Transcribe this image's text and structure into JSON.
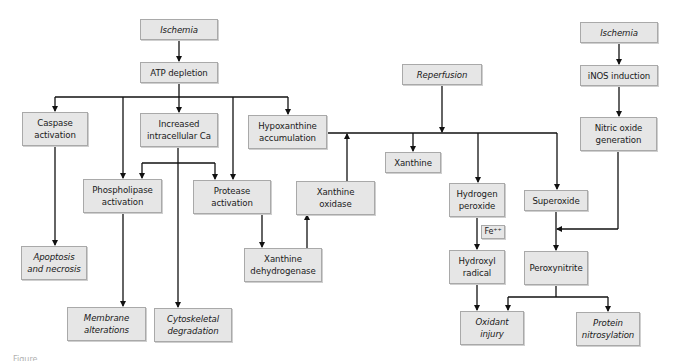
{
  "diagram": {
    "type": "flowchart",
    "nodes": [
      {
        "id": "ischemia_left",
        "label": "Ischemia",
        "italic": true
      },
      {
        "id": "atp_depletion",
        "label": "ATP depletion",
        "italic": false
      },
      {
        "id": "caspase_activation",
        "label": "Caspase\nactivation",
        "italic": false
      },
      {
        "id": "increased_ca",
        "label": "Increased\nintracellular Ca",
        "italic": false
      },
      {
        "id": "hypoxanthine",
        "label": "Hypoxanthine\naccumulation",
        "italic": false
      },
      {
        "id": "phospholipase",
        "label": "Phospholipase\nactivation",
        "italic": false
      },
      {
        "id": "protease",
        "label": "Protease\nactivation",
        "italic": false
      },
      {
        "id": "xanthine_oxidase",
        "label": "Xanthine\noxidase",
        "italic": false
      },
      {
        "id": "apoptosis",
        "label": "Apoptosis\nand necrosis",
        "italic": true
      },
      {
        "id": "xanthine_dehydrogenase",
        "label": "Xanthine\ndehydrogenase",
        "italic": false
      },
      {
        "id": "membrane",
        "label": "Membrane\nalterations",
        "italic": true
      },
      {
        "id": "cytoskeletal",
        "label": "Cytoskeletal\ndegradation",
        "italic": true
      },
      {
        "id": "reperfusion",
        "label": "Reperfusion",
        "italic": true
      },
      {
        "id": "xanthine",
        "label": "Xanthine",
        "italic": false
      },
      {
        "id": "hydrogen_peroxide",
        "label": "Hydrogen\nperoxide",
        "italic": false
      },
      {
        "id": "superoxide",
        "label": "Superoxide",
        "italic": false
      },
      {
        "id": "fe",
        "label": "Fe⁺⁺",
        "italic": false
      },
      {
        "id": "hydroxyl",
        "label": "Hydroxyl\nradical",
        "italic": false
      },
      {
        "id": "peroxynitrite",
        "label": "Peroxynitrite",
        "italic": false
      },
      {
        "id": "oxidant_injury",
        "label": "Oxidant\ninjury",
        "italic": true
      },
      {
        "id": "protein_nitrosylation",
        "label": "Protein\nnitrosylation",
        "italic": true
      },
      {
        "id": "ischemia_right",
        "label": "Ischemia",
        "italic": true
      },
      {
        "id": "inos",
        "label": "iNOS induction",
        "italic": false
      },
      {
        "id": "nitric_oxide",
        "label": "Nitric oxide\ngeneration",
        "italic": false
      }
    ],
    "edges": [
      [
        "ischemia_left",
        "atp_depletion"
      ],
      [
        "atp_depletion",
        "caspase_activation"
      ],
      [
        "atp_depletion",
        "phospholipase"
      ],
      [
        "atp_depletion",
        "increased_ca"
      ],
      [
        "atp_depletion",
        "protease"
      ],
      [
        "atp_depletion",
        "hypoxanthine"
      ],
      [
        "increased_ca",
        "phospholipase"
      ],
      [
        "increased_ca",
        "protease"
      ],
      [
        "increased_ca",
        "cytoskeletal"
      ],
      [
        "caspase_activation",
        "apoptosis"
      ],
      [
        "phospholipase",
        "membrane"
      ],
      [
        "protease",
        "xanthine_dehydrogenase"
      ],
      [
        "xanthine_dehydrogenase",
        "xanthine_oxidase"
      ],
      [
        "xanthine_oxidase",
        "hypoxanthine_line"
      ],
      [
        "hypoxanthine",
        "xanthine"
      ],
      [
        "hypoxanthine",
        "hydrogen_peroxide"
      ],
      [
        "hypoxanthine",
        "superoxide"
      ],
      [
        "reperfusion",
        "hypoxanthine_line"
      ],
      [
        "hydrogen_peroxide",
        "hydroxyl"
      ],
      [
        "hydroxyl",
        "oxidant_injury"
      ],
      [
        "superoxide",
        "peroxynitrite"
      ],
      [
        "nitric_oxide",
        "peroxynitrite"
      ],
      [
        "peroxynitrite",
        "oxidant_injury"
      ],
      [
        "peroxynitrite",
        "protein_nitrosylation"
      ],
      [
        "ischemia_right",
        "inos"
      ],
      [
        "inos",
        "nitric_oxide"
      ]
    ]
  },
  "caption": "Figure"
}
